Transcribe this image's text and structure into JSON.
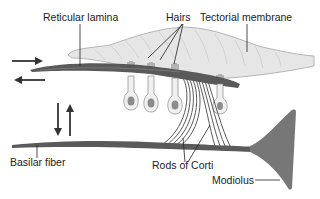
{
  "diagram": {
    "type": "anatomical-illustration",
    "labels": {
      "reticular_lamina": "Reticular lamina",
      "hairs": "Hairs",
      "tectorial_membrane": "Tectorial membrane",
      "basilar_fiber": "Basilar fiber",
      "rods_of_corti": "Rods of Corti",
      "modiolus": "Modiolus"
    },
    "colors": {
      "membrane": "#e6e6e6",
      "membrane_stroke": "#a6a6a6",
      "fiber": "#5a5a5a",
      "cell_fill": "#f0f0f0",
      "nucleus": "#8c8c8c",
      "modiolus": "#777777",
      "arrow": "#333333",
      "text": "#222222"
    },
    "arrows": [
      {
        "name": "shear-right-arrow",
        "direction": "right"
      },
      {
        "name": "shear-left-arrow",
        "direction": "left"
      },
      {
        "name": "down-arrow",
        "direction": "down"
      },
      {
        "name": "up-arrow",
        "direction": "up"
      }
    ],
    "hair_cell_count": 4
  }
}
